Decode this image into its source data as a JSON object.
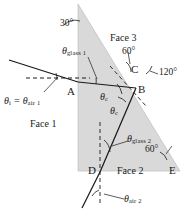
{
  "figure": {
    "kind": "optics-ray-diagram",
    "colors": {
      "prism_fill": "#d9d9d9",
      "ray": "#1a1a1a",
      "normal_dash": "#1a1a1a",
      "text": "#1a1a1a",
      "background": "#ffffff"
    }
  },
  "vertices": {
    "a": "A",
    "b": "B",
    "c": "C",
    "d": "D",
    "e": "E"
  },
  "faces": {
    "face1": "Face 1",
    "face2": "Face 2",
    "face3": "Face 3"
  },
  "angles": {
    "apex": "30°",
    "face3_interior": "60°",
    "exterior_at_c": "120°",
    "face2_interior": "60°"
  },
  "rays": {
    "incident": "θ",
    "incident_sub": "i",
    "incident_eq": "=",
    "incident_air": "θ",
    "incident_air_sub": "air 1",
    "glass1": "θ",
    "glass1_sub": "glass 1",
    "critical_upper": "θ",
    "critical_upper_sub": "c",
    "critical_lower": "θ",
    "critical_lower_sub": "c",
    "glass2": "θ",
    "glass2_sub": "glass 2",
    "air2": "θ",
    "air2_sub": "air 2"
  }
}
